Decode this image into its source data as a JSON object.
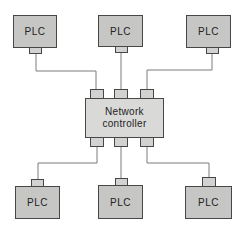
{
  "nodes": {
    "controller": {
      "label": "Network controller",
      "lines": [
        "Network",
        "controller"
      ]
    },
    "top_plcs": [
      {
        "label": "PLC"
      },
      {
        "label": "PLC"
      },
      {
        "label": "PLC"
      }
    ],
    "bottom_plcs": [
      {
        "label": "PLC"
      },
      {
        "label": "PLC"
      },
      {
        "label": "PLC"
      }
    ]
  },
  "colors": {
    "background": "#ffffff",
    "plc_fill": "#c6c6c4",
    "controller_fill": "#d9d9d7",
    "port_fill": "#d2d2d0",
    "border": "#474747",
    "line": "#7d7d7d",
    "text": "#222222"
  }
}
